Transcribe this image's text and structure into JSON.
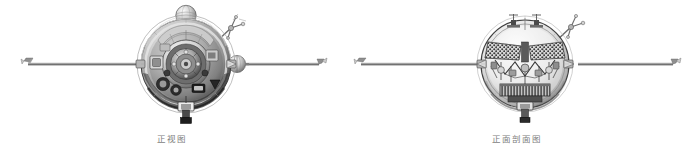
{
  "figure": {
    "background_color": "#ffffff",
    "ink_color": "#4a4a4a",
    "caption_color": "#7d7d7d",
    "views": [
      {
        "id": "front-view",
        "caption": "正视图",
        "boom_count": 2,
        "components": [
          {
            "name": "spherical-body",
            "label": ""
          },
          {
            "name": "top-spherical-tank",
            "label": ""
          },
          {
            "name": "upper-right-sensor-boom",
            "label": ""
          },
          {
            "name": "left-antenna-boom",
            "label": ""
          },
          {
            "name": "right-antenna-boom",
            "label": ""
          },
          {
            "name": "right-boom-sphere",
            "label": ""
          },
          {
            "name": "bottom-nozzle",
            "label": ""
          }
        ]
      },
      {
        "id": "front-section-view",
        "caption": "正面剖面图",
        "boom_count": 2,
        "components": [
          {
            "name": "spherical-shell-cutaway",
            "label": ""
          },
          {
            "name": "internal-battery-array",
            "label": ""
          },
          {
            "name": "internal-equipment-rack",
            "label": ""
          },
          {
            "name": "upper-right-sensor-boom",
            "label": ""
          },
          {
            "name": "left-antenna-boom",
            "label": ""
          },
          {
            "name": "right-antenna-boom",
            "label": ""
          },
          {
            "name": "bottom-nozzle",
            "label": ""
          }
        ]
      }
    ]
  }
}
